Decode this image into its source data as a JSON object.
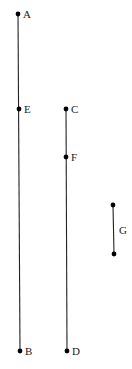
{
  "diagram": {
    "points": [
      {
        "id": "A",
        "label": "A"
      },
      {
        "id": "E",
        "label": "E"
      },
      {
        "id": "B",
        "label": "B"
      },
      {
        "id": "C",
        "label": "C"
      },
      {
        "id": "F",
        "label": "F"
      },
      {
        "id": "D",
        "label": "D"
      }
    ],
    "segments": [
      {
        "id": "AB",
        "from": "A",
        "to": "B",
        "passes_through": [
          "E"
        ]
      },
      {
        "id": "CD",
        "from": "C",
        "to": "D",
        "passes_through": [
          "F"
        ]
      },
      {
        "id": "G",
        "label": "G"
      }
    ],
    "colors": {
      "line": "#222222",
      "point": "#000000",
      "background": "#ffffff"
    }
  }
}
